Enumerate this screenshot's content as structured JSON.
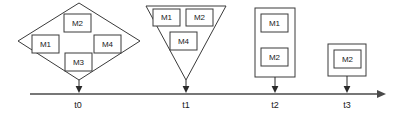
{
  "diagram": {
    "colors": {
      "stroke": "#3a3a3a",
      "axis": "#4a4a4a",
      "text": "#1a1a1a",
      "background": "#ffffff"
    },
    "axis": {
      "name": "timeline-axis",
      "orientation": "horizontal",
      "x_start": 30,
      "x_end": 385,
      "y": 94,
      "arrowhead": "right",
      "ticks": [
        {
          "label": "t0",
          "x": 78
        },
        {
          "label": "t1",
          "x": 186
        },
        {
          "label": "t2",
          "x": 275
        },
        {
          "label": "t3",
          "x": 347
        }
      ]
    },
    "groups": [
      {
        "id": "group-t0",
        "shape": "diamond",
        "tick": "t0",
        "center_x": 79,
        "modules": [
          {
            "label": "M1",
            "x": 32,
            "y": 35,
            "w": 27,
            "h": 18
          },
          {
            "label": "M2",
            "x": 64,
            "y": 14,
            "w": 27,
            "h": 18
          },
          {
            "label": "M3",
            "x": 65,
            "y": 53,
            "w": 27,
            "h": 18
          },
          {
            "label": "M4",
            "x": 94,
            "y": 35,
            "w": 27,
            "h": 18
          }
        ]
      },
      {
        "id": "group-t1",
        "shape": "inverted-triangle",
        "tick": "t1",
        "center_x": 186,
        "modules": [
          {
            "label": "M1",
            "x": 153,
            "y": 9,
            "w": 27,
            "h": 17
          },
          {
            "label": "M2",
            "x": 186,
            "y": 9,
            "w": 27,
            "h": 17
          },
          {
            "label": "M4",
            "x": 170,
            "y": 32,
            "w": 27,
            "h": 18
          }
        ]
      },
      {
        "id": "group-t2",
        "shape": "rectangle",
        "tick": "t2",
        "center_x": 275,
        "modules": [
          {
            "label": "M1",
            "x": 261,
            "y": 14,
            "w": 27,
            "h": 18
          },
          {
            "label": "M2",
            "x": 261,
            "y": 48,
            "w": 27,
            "h": 18
          }
        ]
      },
      {
        "id": "group-t3",
        "shape": "square",
        "tick": "t3",
        "center_x": 347,
        "modules": [
          {
            "label": "M2",
            "x": 334,
            "y": 50,
            "w": 27,
            "h": 18
          }
        ]
      }
    ]
  }
}
